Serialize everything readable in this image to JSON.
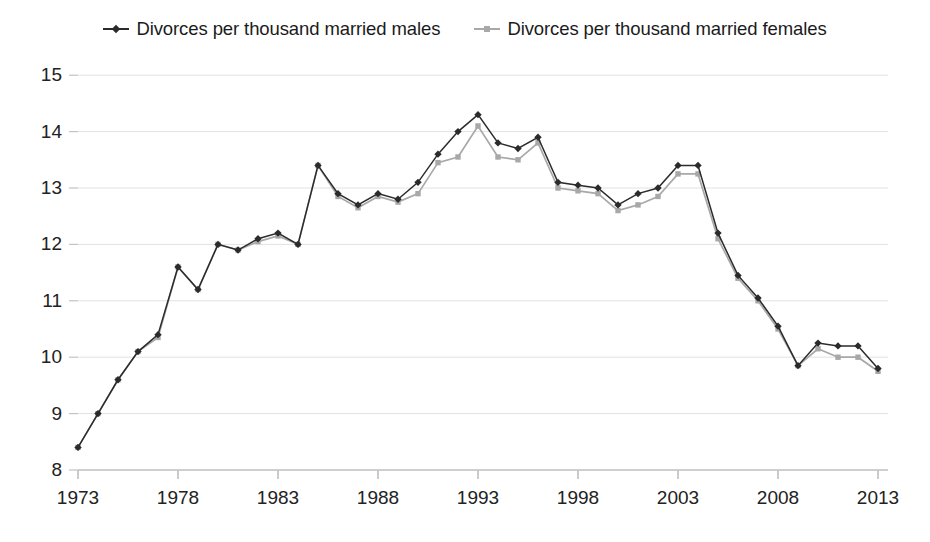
{
  "legend": {
    "position": "top-center",
    "items": [
      {
        "label": "Divorces per thousand married males",
        "color": "#2b2b2b",
        "marker": "diamond-marker"
      },
      {
        "label": "Divorces per thousand married females",
        "color": "#a8a8a8",
        "marker": "square-marker"
      }
    ]
  },
  "chart_data": {
    "type": "line",
    "title": "",
    "xlabel": "",
    "ylabel": "",
    "xlim": [
      1973,
      2013
    ],
    "ylim": [
      8,
      15
    ],
    "ytick_labels": [
      "8",
      "9",
      "10",
      "11",
      "12",
      "13",
      "14",
      "15"
    ],
    "yticks": [
      8,
      9,
      10,
      11,
      12,
      13,
      14,
      15
    ],
    "xtick_labels": [
      "1973",
      "1978",
      "1983",
      "1988",
      "1993",
      "1998",
      "2003",
      "2008",
      "2013"
    ],
    "xticks": [
      1973,
      1978,
      1983,
      1988,
      1993,
      1998,
      2003,
      2008,
      2013
    ],
    "grid": "horizontal",
    "x": [
      1973,
      1974,
      1975,
      1976,
      1977,
      1978,
      1979,
      1980,
      1981,
      1982,
      1983,
      1984,
      1985,
      1986,
      1987,
      1988,
      1989,
      1990,
      1991,
      1992,
      1993,
      1994,
      1995,
      1996,
      1997,
      1998,
      1999,
      2000,
      2001,
      2002,
      2003,
      2004,
      2005,
      2006,
      2007,
      2008,
      2009,
      2010,
      2011,
      2012,
      2013
    ],
    "series": [
      {
        "name": "Divorces per thousand married males",
        "color": "#2b2b2b",
        "values": [
          8.4,
          9.0,
          9.6,
          10.1,
          10.4,
          11.6,
          11.2,
          12.0,
          11.9,
          12.1,
          12.2,
          12.0,
          13.4,
          12.9,
          12.7,
          12.9,
          12.8,
          13.1,
          13.6,
          14.0,
          14.3,
          13.8,
          13.7,
          13.9,
          13.1,
          13.05,
          13.0,
          12.7,
          12.9,
          13.0,
          13.4,
          13.4,
          12.2,
          11.45,
          11.05,
          10.55,
          9.85,
          10.25,
          10.2,
          10.2,
          9.8
        ]
      },
      {
        "name": "Divorces per thousand married females",
        "color": "#a8a8a8",
        "values": [
          8.4,
          9.0,
          9.6,
          10.1,
          10.35,
          11.6,
          11.2,
          12.0,
          11.9,
          12.05,
          12.15,
          12.0,
          13.4,
          12.85,
          12.65,
          12.85,
          12.75,
          12.9,
          13.45,
          13.55,
          14.1,
          13.55,
          13.5,
          13.8,
          13.0,
          12.95,
          12.9,
          12.6,
          12.7,
          12.85,
          13.25,
          13.25,
          12.1,
          11.4,
          11.0,
          10.5,
          9.85,
          10.15,
          10.0,
          10.0,
          9.75
        ]
      }
    ]
  },
  "plot_geometry": {
    "left": 78,
    "right": 878,
    "top_value_y": 75,
    "unit_px": 56.4,
    "axis_baseline_y": 470
  }
}
